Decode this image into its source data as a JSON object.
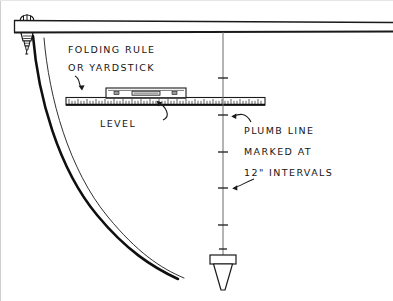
{
  "figure": {
    "background_color": "#ffffff",
    "ink_color": "#151515",
    "width": 393,
    "height": 301
  },
  "annotations": {
    "folding_rule_line1": "FOLDING RULE",
    "folding_rule_line2": "OR YARDSTICK",
    "level": "LEVEL",
    "plumb_line_line1": "PLUMB LINE",
    "plumb_line_line2": "MARKED AT",
    "plumb_line_line3": "12\" INTERVALS"
  },
  "parts": {
    "beam": "horizontal beam",
    "hanger_nail": "nail hanger",
    "folding_rule": "folding rule or yardstick",
    "spirit_level": "spirit level",
    "plumb_line": "plumb line string",
    "plumb_bob": "plumb bob",
    "curved_edge": "curved ground contour"
  },
  "plumb_line": {
    "x": 223,
    "top_y": 32,
    "bottom_y": 258,
    "tick_count": 6,
    "tick_interval_label": "12\""
  }
}
